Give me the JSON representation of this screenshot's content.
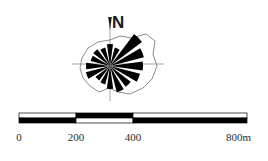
{
  "figure": {
    "kind": "map-legend",
    "background_color": "#ffffff",
    "ink_color": "#000000",
    "axis_color": "#9a9a9a",
    "outline_color": "#6e6e6e"
  },
  "north_arrow": {
    "label": "N",
    "arrow_icon": "north-arrow-icon",
    "center_x": 110,
    "center_y": 66,
    "axis": {
      "horizontal": {
        "x1": 72,
        "x2": 164,
        "y": 64
      },
      "vertical": {
        "y1": 25,
        "y2": 101,
        "x": 110
      }
    }
  },
  "chart_data": {
    "type": "rose",
    "title": "",
    "subtitle": "",
    "xlabel": "",
    "ylabel": "",
    "legend_position": "none",
    "grid": false,
    "center": [
      110,
      66
    ],
    "units": "relative frequency",
    "note": "Wind-rose / orientation-rose petals, 16 directions, drawn as filled black triangular sectors radiating from the centre. Values are petal lengths in px as rendered.",
    "categories": [
      "N",
      "NNE",
      "NE",
      "ENE",
      "E",
      "ESE",
      "SE",
      "SSE",
      "S",
      "SSW",
      "SW",
      "WSW",
      "W",
      "WNW",
      "NW",
      "NNW"
    ],
    "values": [
      22,
      19,
      40,
      35,
      33,
      31,
      26,
      27,
      23,
      19,
      18,
      25,
      24,
      20,
      21,
      19
    ],
    "petal_half_width_deg": 8,
    "outline_polygon": [
      [
        110,
        40
      ],
      [
        120,
        36
      ],
      [
        132,
        38
      ],
      [
        146,
        34
      ],
      [
        155,
        41
      ],
      [
        153,
        54
      ],
      [
        157,
        66
      ],
      [
        152,
        79
      ],
      [
        143,
        88
      ],
      [
        130,
        94
      ],
      [
        118,
        92
      ],
      [
        109,
        88
      ],
      [
        99,
        92
      ],
      [
        90,
        86
      ],
      [
        83,
        78
      ],
      [
        80,
        68
      ],
      [
        82,
        58
      ],
      [
        88,
        48
      ],
      [
        98,
        42
      ]
    ]
  },
  "scale_bar": {
    "name": "map-scale-bar",
    "x_start": 19,
    "x_end": 247,
    "top_y": 113,
    "bar_height": 5,
    "ticks": [
      {
        "label": "0",
        "value": 0,
        "x": 19
      },
      {
        "label": "200",
        "value": 200,
        "x": 76
      },
      {
        "label": "400",
        "value": 400,
        "x": 133
      },
      {
        "label": "800m",
        "value": 800,
        "x": 247
      }
    ],
    "segments_top": [
      {
        "from": 19,
        "to": 76,
        "fill": "#ffffff"
      },
      {
        "from": 76,
        "to": 133,
        "fill": "#000000"
      },
      {
        "from": 133,
        "to": 247,
        "fill": "#ffffff"
      }
    ],
    "segments_bottom": [
      {
        "from": 19,
        "to": 76,
        "fill": "#000000"
      },
      {
        "from": 76,
        "to": 133,
        "fill": "#ffffff"
      },
      {
        "from": 133,
        "to": 247,
        "fill": "#000000"
      }
    ],
    "label_y": 132
  }
}
